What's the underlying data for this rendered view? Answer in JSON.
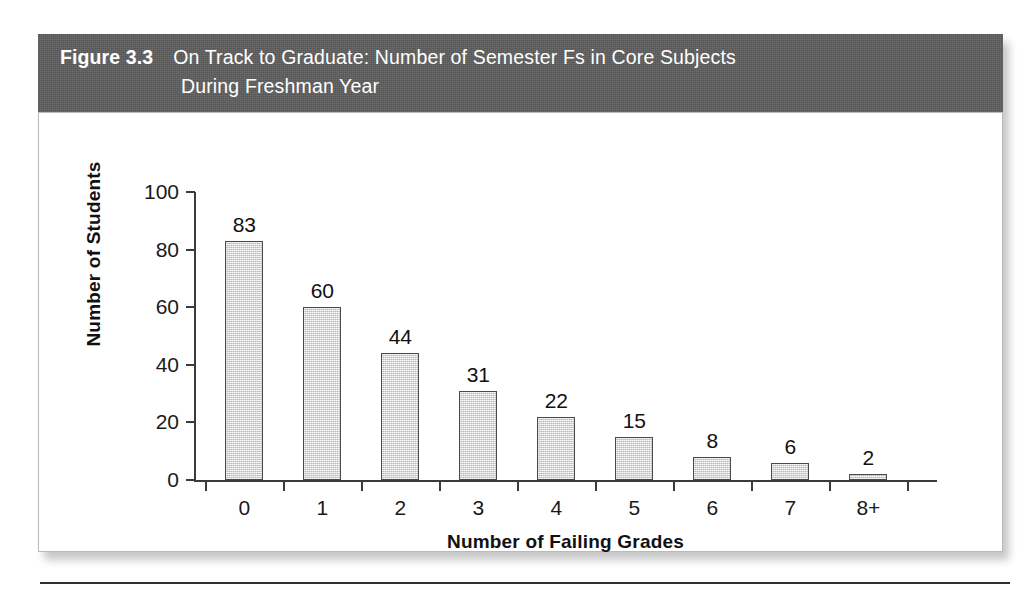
{
  "figure": {
    "number_label": "Figure 3.3",
    "title_line1": "On Track to Graduate: Number of Semester Fs in Core Subjects",
    "title_line2": "During Freshman Year",
    "band_color": "#5e5e5e",
    "band_text_color": "#ffffff"
  },
  "chart_data": {
    "type": "bar",
    "title": "On Track to Graduate: Number of Semester Fs in Core Subjects During Freshman Year",
    "categories": [
      "0",
      "1",
      "2",
      "3",
      "4",
      "5",
      "6",
      "7",
      "8+"
    ],
    "values": [
      83,
      60,
      44,
      31,
      22,
      15,
      8,
      6,
      2
    ],
    "data_labels": [
      "83",
      "60",
      "44",
      "31",
      "22",
      "15",
      "8",
      "6",
      "2"
    ],
    "xlabel": "Number of Failing Grades",
    "ylabel": "Number of Students",
    "ylim": [
      0,
      100
    ],
    "yticks": [
      0,
      20,
      40,
      60,
      80,
      100
    ],
    "ytick_labels": [
      "0",
      "20",
      "40",
      "60",
      "80",
      "100"
    ],
    "grid": false,
    "legend": false,
    "bar_fill_color": "#dcdcdc",
    "bar_edge_color": "#4a4a4a",
    "axis_color": "#3b3b3b"
  }
}
